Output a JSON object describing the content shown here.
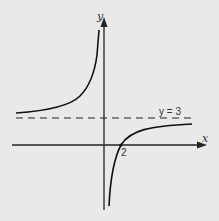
{
  "diagram": {
    "type": "function graph (rectangular hyperbola)",
    "axes": {
      "x_label": "x",
      "y_label": "y"
    },
    "asymptote": {
      "label": "y = 3",
      "style": "dashed"
    },
    "x_intercept_label": "2",
    "colors": {
      "background": "#e9e9e9",
      "ink": "#1a1a1a"
    }
  }
}
